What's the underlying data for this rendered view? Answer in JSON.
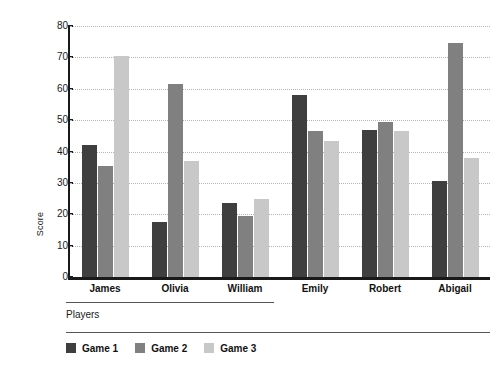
{
  "chart_data": {
    "type": "bar",
    "title": "",
    "xlabel": "Players",
    "ylabel": "Score",
    "ylim": [
      0,
      80
    ],
    "yticks": [
      0,
      10,
      20,
      30,
      40,
      50,
      60,
      70,
      80
    ],
    "ytick_labels": [
      "0",
      "10",
      "20",
      "30",
      "40",
      "50",
      "60",
      "70",
      "80"
    ],
    "grid": "horizontal-dotted",
    "legend_position": "bottom-left",
    "categories": [
      "James",
      "Olivia",
      "William",
      "Emily",
      "Robert",
      "Abigail"
    ],
    "series": [
      {
        "name": "Game 1",
        "color": "#3f3f3f",
        "values": [
          42,
          17.5,
          23.5,
          58,
          47,
          30.5
        ]
      },
      {
        "name": "Game 2",
        "color": "#808080",
        "values": [
          35.5,
          61.5,
          19.5,
          46.5,
          49.5,
          74.5
        ]
      },
      {
        "name": "Game 3",
        "color": "#c8c8c8",
        "values": [
          70.5,
          37,
          25,
          43.5,
          46.5,
          38
        ]
      }
    ]
  }
}
